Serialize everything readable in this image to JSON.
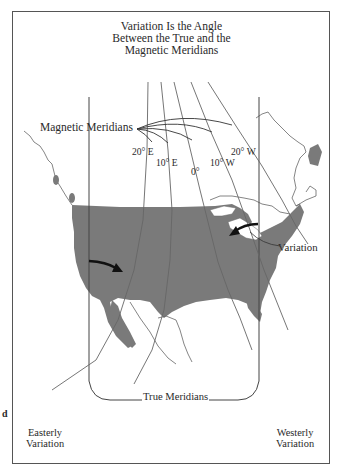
{
  "title": {
    "lines": [
      "Variation Is the Angle",
      "Between the True and the",
      "Magnetic Meridians"
    ]
  },
  "labels": {
    "magnetic_meridians": "Magnetic Meridians",
    "variation": "Variation",
    "true_meridians": "True Meridians",
    "easterly_variation": [
      "Easterly",
      "Variation"
    ],
    "westerly_variation": [
      "Westerly",
      "Variation"
    ],
    "stray_mark": "d"
  },
  "isogonic_lines": [
    {
      "label": "20° E"
    },
    {
      "label": "10° E"
    },
    {
      "label": "0°"
    },
    {
      "label": "10° W"
    },
    {
      "label": "20° W"
    }
  ],
  "colors": {
    "land_fill": "#7a7a7a",
    "line": "#555555",
    "arrow": "#111111",
    "background": "#ffffff"
  }
}
